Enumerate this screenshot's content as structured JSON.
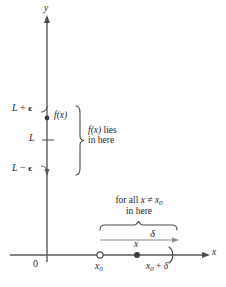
{
  "figure": {
    "axes": {
      "y_label": "y",
      "x_label": "x",
      "origin_label": "0"
    },
    "y_axis_ticks": [
      {
        "id": "L_plus_eps",
        "label_main": "L",
        "label_op": "+",
        "label_sym": "ϵ",
        "y": 110
      },
      {
        "id": "L",
        "label_main": "L",
        "label_op": "",
        "label_sym": "",
        "y": 140
      },
      {
        "id": "L_minus_eps",
        "label_main": "L",
        "label_op": "−",
        "label_sym": "ϵ",
        "y": 170
      }
    ],
    "fx_point": {
      "label_fn": "f",
      "label_arg": "(x)",
      "label": "f(x)",
      "y": 118
    },
    "vertical_brace_note": {
      "line1_fn": "f",
      "line1_arg": "(x)",
      "line1_tail": " lies",
      "line1": "f(x) lies",
      "line2": "in here"
    },
    "horizontal_brace_note": {
      "line1_prefix": "for all ",
      "line1_var": "x",
      "line1_rel": " ≠ ",
      "line1_var2": "x",
      "line1_sub": "0",
      "line1": "for all x ≠ x₀",
      "line2": "in here"
    },
    "delta_arrow": {
      "label": "δ"
    },
    "x_axis_points": [
      {
        "id": "x0",
        "label_main": "x",
        "label_sub": "0",
        "label": "x₀",
        "marker": "open-circle",
        "x": 100
      },
      {
        "id": "x",
        "label_main": "x",
        "label_sub": "",
        "label": "x",
        "marker": "filled-dot",
        "x": 137
      },
      {
        "id": "x0_plus_delta",
        "label_main": "x",
        "label_sub": "0",
        "label_op": " + ",
        "label_sym": "δ",
        "label": "x₀ + δ",
        "marker": "right-paren",
        "x": 172
      }
    ],
    "colors": {
      "axis": "#5a5a5a",
      "text": "#262626",
      "brace": "#4a4a4a",
      "arrow": "#7a7a7a"
    }
  }
}
